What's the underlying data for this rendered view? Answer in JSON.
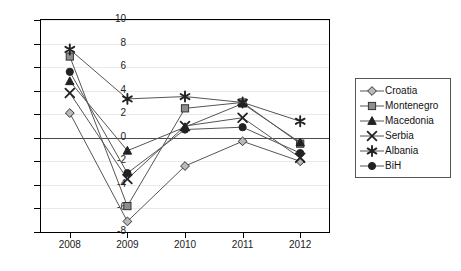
{
  "chart_data": {
    "type": "line",
    "title": "",
    "subtitle": "",
    "xlabel": "",
    "ylabel": "",
    "categories": [
      "2008",
      "2009",
      "2010",
      "2011",
      "2012"
    ],
    "x": [
      2008,
      2009,
      2010,
      2011,
      2012
    ],
    "ylim": [
      -8,
      10
    ],
    "yticks": [
      -8,
      -6,
      -4,
      -2,
      0,
      2,
      4,
      6,
      8,
      10
    ],
    "ytick_labels": [
      "-8",
      "-6",
      "-4",
      "-2",
      "0",
      "2",
      "4",
      "6",
      "8",
      "10"
    ],
    "grid": true,
    "grid_axis": "y",
    "legend_position": "right",
    "zero_line": true,
    "series": [
      {
        "name": "Croatia",
        "marker": "diamond",
        "values": [
          2.1,
          -7.1,
          -2.4,
          -0.3,
          -2.0
        ]
      },
      {
        "name": "Montenegro",
        "marker": "square",
        "values": [
          6.9,
          -5.8,
          2.5,
          3.0,
          -0.5
        ]
      },
      {
        "name": "Macedonia",
        "marker": "triangle",
        "values": [
          4.8,
          -1.1,
          0.9,
          2.9,
          -0.4
        ]
      },
      {
        "name": "Serbia",
        "marker": "x",
        "values": [
          3.8,
          -3.5,
          1.0,
          1.7,
          -1.7
        ]
      },
      {
        "name": "Albania",
        "marker": "asterisk",
        "values": [
          7.5,
          3.3,
          3.5,
          3.0,
          1.4
        ]
      },
      {
        "name": "BiH",
        "marker": "circle",
        "values": [
          5.6,
          -3.0,
          0.7,
          0.9,
          -1.3
        ]
      }
    ]
  },
  "legend": {
    "entries": [
      {
        "label": "Croatia"
      },
      {
        "label": "Montenegro"
      },
      {
        "label": "Macedonia"
      },
      {
        "label": "Serbia"
      },
      {
        "label": "Albania"
      },
      {
        "label": "BiH"
      }
    ]
  },
  "colors": {
    "line": "#555555",
    "marker_fill_light": "#b9b9b9",
    "marker_dark": "#222222",
    "grid": "#e9e9e9",
    "axis": "#000000",
    "zero_line": "#4a4a4a",
    "background": "#ffffff"
  }
}
